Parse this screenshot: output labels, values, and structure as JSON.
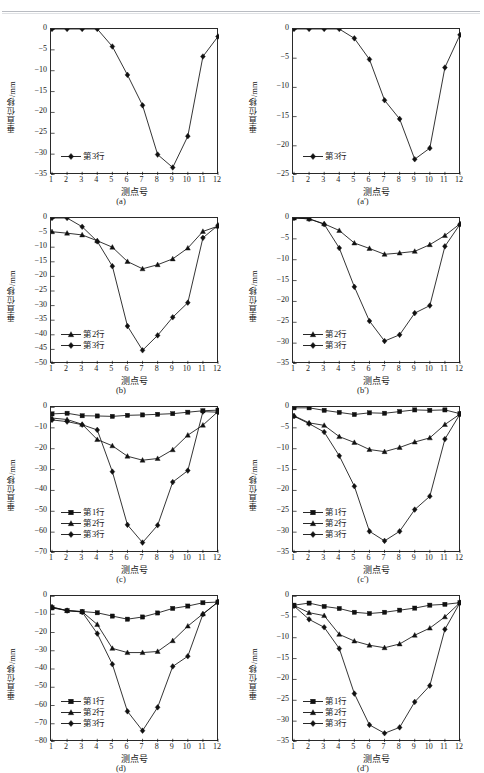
{
  "page": {
    "header_ghost_text": "",
    "background": "#ffffff",
    "line_color": "#1a1a1a"
  },
  "axis_labels": {
    "y": "垂直位移/mm",
    "x": "测点号"
  },
  "series_names": {
    "row1": "第1行",
    "row2": "第2行",
    "row3": "第3行"
  },
  "markers": {
    "row1": "square",
    "row2": "triangle",
    "row3": "diamond"
  },
  "chart_data": [
    {
      "id": "a",
      "type": "line",
      "caption": "(a)",
      "title": "",
      "xlabel": "测点号",
      "ylabel": "垂直位移/mm",
      "categories": [
        1,
        2,
        3,
        4,
        5,
        6,
        7,
        8,
        9,
        10,
        11,
        12
      ],
      "xticks": [
        "1",
        "2",
        "3",
        "4",
        "5",
        "6",
        "7",
        "8",
        "9",
        "10",
        "11",
        "12"
      ],
      "yticks": [
        "0",
        "-5",
        "-10",
        "-15",
        "-20",
        "-25",
        "-30",
        "-35"
      ],
      "ylim": [
        -35,
        0
      ],
      "xlim": [
        1,
        12
      ],
      "grid": false,
      "legend_position": "lower-left",
      "series": [
        {
          "name": "第3行",
          "marker": "diamond",
          "values": [
            0,
            0,
            0,
            0,
            -4.2,
            -11.0,
            -18.3,
            -30.1,
            -33.2,
            -25.7,
            -6.6,
            -1.8
          ]
        }
      ]
    },
    {
      "id": "a-prime",
      "type": "line",
      "caption": "(a′)",
      "title": "",
      "xlabel": "测点号",
      "ylabel": "垂直位移/mm",
      "categories": [
        1,
        2,
        3,
        4,
        5,
        6,
        7,
        8,
        9,
        10,
        11,
        12
      ],
      "xticks": [
        "1",
        "2",
        "3",
        "4",
        "5",
        "6",
        "7",
        "8",
        "9",
        "10",
        "11",
        "12"
      ],
      "yticks": [
        "0",
        "-5",
        "-10",
        "-15",
        "-20",
        "-25"
      ],
      "ylim": [
        -25,
        0
      ],
      "xlim": [
        1,
        12
      ],
      "grid": false,
      "legend_position": "lower-left",
      "series": [
        {
          "name": "第3行",
          "marker": "diamond",
          "values": [
            0,
            0,
            0,
            0,
            -1.6,
            -5.2,
            -12.2,
            -15.4,
            -22.3,
            -20.4,
            -6.6,
            -1.0
          ]
        }
      ]
    },
    {
      "id": "b",
      "type": "line",
      "caption": "(b)",
      "title": "",
      "xlabel": "测点号",
      "ylabel": "垂直位移/mm",
      "categories": [
        1,
        2,
        3,
        4,
        5,
        6,
        7,
        8,
        9,
        10,
        11,
        12
      ],
      "xticks": [
        "1",
        "2",
        "3",
        "4",
        "5",
        "6",
        "7",
        "8",
        "9",
        "10",
        "11",
        "12"
      ],
      "yticks": [
        "0",
        "-5",
        "-10",
        "-15",
        "-20",
        "-25",
        "-30",
        "-35",
        "-40",
        "-45",
        "-50"
      ],
      "ylim": [
        -50,
        0
      ],
      "xlim": [
        1,
        12
      ],
      "grid": false,
      "legend_position": "lower-left",
      "series": [
        {
          "name": "第2行",
          "marker": "triangle",
          "values": [
            -4.7,
            -5.2,
            -5.8,
            -7.8,
            -10.0,
            -14.9,
            -17.4,
            -16.0,
            -14.0,
            -10.3,
            -4.6,
            -2.8
          ]
        },
        {
          "name": "第3行",
          "marker": "diamond",
          "values": [
            0,
            0,
            -3.0,
            -8.0,
            -16.5,
            -37.0,
            -45.3,
            -40.2,
            -34.0,
            -29.0,
            -6.8,
            -2.5
          ]
        }
      ]
    },
    {
      "id": "b-prime",
      "type": "line",
      "caption": "(b′)",
      "title": "",
      "xlabel": "测点号",
      "ylabel": "垂直位移/mm",
      "categories": [
        1,
        2,
        3,
        4,
        5,
        6,
        7,
        8,
        9,
        10,
        11,
        12
      ],
      "xticks": [
        "1",
        "2",
        "3",
        "4",
        "5",
        "6",
        "7",
        "8",
        "9",
        "10",
        "11",
        "12"
      ],
      "yticks": [
        "0",
        "-5",
        "-10",
        "-15",
        "-20",
        "-25",
        "-30",
        "-35"
      ],
      "ylim": [
        -35,
        0
      ],
      "xlim": [
        1,
        12
      ],
      "grid": false,
      "legend_position": "lower-left",
      "series": [
        {
          "name": "第2行",
          "marker": "triangle",
          "values": [
            0,
            -0.2,
            -1.4,
            -3.0,
            -6.0,
            -7.3,
            -8.7,
            -8.4,
            -8.0,
            -6.4,
            -4.2,
            -1.4
          ]
        },
        {
          "name": "第3行",
          "marker": "diamond",
          "values": [
            0,
            -0.2,
            -1.5,
            -7.2,
            -16.5,
            -24.7,
            -29.5,
            -28.0,
            -22.8,
            -21.0,
            -6.8,
            -1.5
          ]
        }
      ]
    },
    {
      "id": "c",
      "type": "line",
      "caption": "(c)",
      "title": "",
      "xlabel": "测点号",
      "ylabel": "垂直位移/mm",
      "categories": [
        1,
        2,
        3,
        4,
        5,
        6,
        7,
        8,
        9,
        10,
        11,
        12
      ],
      "xticks": [
        "1",
        "2",
        "3",
        "4",
        "5",
        "6",
        "7",
        "8",
        "9",
        "10",
        "11",
        "12"
      ],
      "yticks": [
        "0",
        "-10",
        "-20",
        "-30",
        "-40",
        "-50",
        "-60",
        "-70"
      ],
      "ylim": [
        -70,
        0
      ],
      "xlim": [
        1,
        12
      ],
      "grid": false,
      "legend_position": "lower-left",
      "series": [
        {
          "name": "第1行",
          "marker": "square",
          "values": [
            -3.3,
            -3.0,
            -4.2,
            -4.3,
            -4.5,
            -4.0,
            -3.8,
            -3.5,
            -3.2,
            -2.5,
            -1.8,
            -1.5
          ]
        },
        {
          "name": "第2行",
          "marker": "triangle",
          "values": [
            -5.3,
            -6.0,
            -8.3,
            -15.6,
            -18.6,
            -23.6,
            -25.5,
            -24.7,
            -20.5,
            -13.5,
            -8.7,
            -2.2
          ]
        },
        {
          "name": "第3行",
          "marker": "diamond",
          "values": [
            -6.2,
            -7.0,
            -8.5,
            -11.0,
            -31.0,
            -56.5,
            -65.0,
            -56.7,
            -36.0,
            -30.5,
            -2.2,
            -2.5
          ]
        }
      ]
    },
    {
      "id": "c-prime",
      "type": "line",
      "caption": "(c′)",
      "title": "",
      "xlabel": "测点号",
      "ylabel": "垂直位移/mm",
      "categories": [
        1,
        2,
        3,
        4,
        5,
        6,
        7,
        8,
        9,
        10,
        11,
        12
      ],
      "xticks": [
        "1",
        "2",
        "3",
        "4",
        "5",
        "6",
        "7",
        "8",
        "9",
        "10",
        "11",
        "12"
      ],
      "yticks": [
        "0",
        "-5",
        "-10",
        "-15",
        "-20",
        "-25",
        "-30",
        "-35"
      ],
      "ylim": [
        -35,
        0
      ],
      "xlim": [
        1,
        12
      ],
      "grid": false,
      "legend_position": "lower-left",
      "series": [
        {
          "name": "第1行",
          "marker": "square",
          "values": [
            -0.2,
            -0.2,
            -0.8,
            -1.3,
            -1.8,
            -1.4,
            -1.5,
            -1.1,
            -0.7,
            -0.8,
            -0.7,
            -1.6
          ]
        },
        {
          "name": "第2行",
          "marker": "triangle",
          "values": [
            -2.1,
            -3.8,
            -4.4,
            -7.1,
            -8.5,
            -10.2,
            -10.7,
            -9.7,
            -8.4,
            -7.4,
            -4.2,
            -1.7
          ]
        },
        {
          "name": "第3行",
          "marker": "diamond",
          "values": [
            -2.2,
            -4.0,
            -6.0,
            -11.7,
            -19.0,
            -29.8,
            -32.1,
            -29.8,
            -24.6,
            -21.4,
            -7.7,
            -1.7
          ]
        }
      ]
    },
    {
      "id": "d",
      "type": "line",
      "caption": "(d)",
      "title": "",
      "xlabel": "测点号",
      "ylabel": "垂直位移/mm",
      "categories": [
        1,
        2,
        3,
        4,
        5,
        6,
        7,
        8,
        9,
        10,
        11,
        12
      ],
      "xticks": [
        "1",
        "2",
        "3",
        "4",
        "5",
        "6",
        "7",
        "8",
        "9",
        "10",
        "11",
        "12"
      ],
      "yticks": [
        "0",
        "-10",
        "-20",
        "-30",
        "-40",
        "-50",
        "-60",
        "-70",
        "-80"
      ],
      "ylim": [
        -80,
        0
      ],
      "xlim": [
        1,
        12
      ],
      "grid": false,
      "legend_position": "lower-left",
      "series": [
        {
          "name": "第1行",
          "marker": "square",
          "values": [
            -6.5,
            -8.0,
            -8.5,
            -9.2,
            -11.0,
            -12.7,
            -11.5,
            -9.3,
            -6.8,
            -5.5,
            -3.7,
            -3.3
          ]
        },
        {
          "name": "第2行",
          "marker": "triangle",
          "values": [
            -6.0,
            -8.0,
            -8.6,
            -15.6,
            -28.7,
            -31.0,
            -31.0,
            -30.4,
            -24.5,
            -16.5,
            -9.8,
            -3.3
          ]
        },
        {
          "name": "第3行",
          "marker": "diamond",
          "values": [
            -6.2,
            -8.0,
            -8.8,
            -20.6,
            -37.4,
            -63.2,
            -73.8,
            -61.0,
            -38.6,
            -33.0,
            -10.0,
            -3.3
          ]
        }
      ]
    },
    {
      "id": "d-prime",
      "type": "line",
      "caption": "(d′)",
      "title": "",
      "xlabel": "测点号",
      "ylabel": "垂直位移/mm",
      "categories": [
        1,
        2,
        3,
        4,
        5,
        6,
        7,
        8,
        9,
        10,
        11,
        12
      ],
      "xticks": [
        "1",
        "2",
        "3",
        "4",
        "5",
        "6",
        "7",
        "8",
        "9",
        "10",
        "11",
        "12"
      ],
      "yticks": [
        "0",
        "-5",
        "-10",
        "-15",
        "-20",
        "-25",
        "-30",
        "-35"
      ],
      "ylim": [
        -35,
        0
      ],
      "xlim": [
        1,
        12
      ],
      "grid": false,
      "legend_position": "lower-left",
      "series": [
        {
          "name": "第1行",
          "marker": "square",
          "values": [
            -2.2,
            -1.7,
            -2.5,
            -3.0,
            -3.9,
            -4.2,
            -3.9,
            -3.4,
            -2.9,
            -2.2,
            -2.0,
            -1.6
          ]
        },
        {
          "name": "第2行",
          "marker": "triangle",
          "values": [
            -2.3,
            -4.0,
            -4.7,
            -9.2,
            -10.8,
            -11.8,
            -12.4,
            -11.5,
            -9.4,
            -7.7,
            -5.0,
            -1.6
          ]
        },
        {
          "name": "第3行",
          "marker": "diamond",
          "values": [
            -2.4,
            -5.6,
            -7.5,
            -12.6,
            -23.4,
            -30.9,
            -32.9,
            -31.5,
            -25.4,
            -21.5,
            -8.0,
            -1.6
          ]
        }
      ]
    }
  ]
}
